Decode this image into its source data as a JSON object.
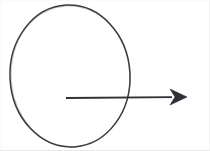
{
  "figure": {
    "description": "A hand-drawn oval with a horizontal arrow pointing right, starting inside the oval and extending past its right edge.",
    "background_color": "#ffffff",
    "stroke_color": "#3a3a40",
    "border_color": "#e9e9e9",
    "width": 210,
    "height": 151
  },
  "shapes": {
    "ellipse": {
      "name": "ellipse-outline",
      "label": "Oval",
      "center_x": 70,
      "center_y": 76,
      "radius_x": 60,
      "radius_y": 71,
      "rotation_deg": -3,
      "stroke_width": 1.5,
      "fill": "none",
      "stroke": "#3a3a40"
    },
    "arrow": {
      "name": "horizontal-arrow",
      "label": "Arrow",
      "start_x": 66,
      "start_y": 98,
      "end_x": 187,
      "end_y": 97,
      "shaft_width": 1.8,
      "stroke": "#2f2f35",
      "head_length": 17,
      "head_half_width": 8,
      "head_notch": 5,
      "head_style": "barbed-filled-triangle",
      "direction": "right"
    }
  }
}
